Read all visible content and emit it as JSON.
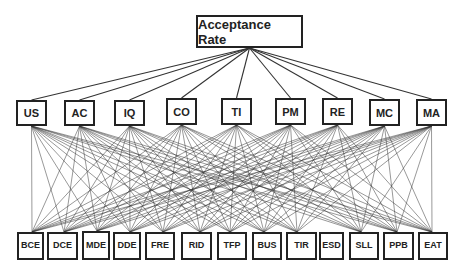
{
  "diagram": {
    "title_node": {
      "label": "Acceptance Rate",
      "x": 196,
      "y": 15,
      "w": 107,
      "h": 33
    },
    "factors": [
      {
        "id": "US",
        "label": "US",
        "x": 16,
        "y": 100,
        "w": 31,
        "h": 26
      },
      {
        "id": "AC",
        "label": "AC",
        "x": 64,
        "y": 100,
        "w": 31,
        "h": 26
      },
      {
        "id": "IQ",
        "label": "IQ",
        "x": 114,
        "y": 100,
        "w": 31,
        "h": 26
      },
      {
        "id": "CO",
        "label": "CO",
        "x": 166,
        "y": 98,
        "w": 31,
        "h": 27
      },
      {
        "id": "TI",
        "label": "TI",
        "x": 221,
        "y": 98,
        "w": 31,
        "h": 27
      },
      {
        "id": "PM",
        "label": "PM",
        "x": 275,
        "y": 98,
        "w": 31,
        "h": 27
      },
      {
        "id": "RE",
        "label": "RE",
        "x": 322,
        "y": 98,
        "w": 31,
        "h": 27
      },
      {
        "id": "MC",
        "label": "MC",
        "x": 369,
        "y": 99,
        "w": 31,
        "h": 27
      },
      {
        "id": "MA",
        "label": "MA",
        "x": 416,
        "y": 99,
        "w": 31,
        "h": 27
      }
    ],
    "indicators": [
      {
        "id": "BCE",
        "label": "BCE",
        "x": 17,
        "y": 232,
        "w": 27,
        "h": 28,
        "anchor": 32,
        "connected": true
      },
      {
        "id": "DCE",
        "label": "DCE",
        "x": 47,
        "y": 232,
        "w": 31,
        "h": 28,
        "anchor": 64,
        "connected": true
      },
      {
        "id": "MDE",
        "label": "MDE",
        "x": 82,
        "y": 231,
        "w": 28,
        "h": 29,
        "anchor": 97,
        "connected": true
      },
      {
        "id": "DDE",
        "label": "DDE",
        "x": 113,
        "y": 232,
        "w": 28,
        "h": 28,
        "anchor": 130,
        "connected": true
      },
      {
        "id": "FRE",
        "label": "FRE",
        "x": 145,
        "y": 232,
        "w": 30,
        "h": 28,
        "anchor": 163,
        "connected": true
      },
      {
        "id": "RID",
        "label": "RID",
        "x": 181,
        "y": 232,
        "w": 31,
        "h": 28,
        "anchor": 200,
        "connected": true
      },
      {
        "id": "TFP",
        "label": "TFP",
        "x": 217,
        "y": 232,
        "w": 30,
        "h": 28,
        "anchor": 230,
        "connected": true
      },
      {
        "id": "BUS",
        "label": "BUS",
        "x": 252,
        "y": 232,
        "w": 30,
        "h": 28,
        "anchor": 264,
        "connected": true
      },
      {
        "id": "TIR",
        "label": "TIR",
        "x": 286,
        "y": 232,
        "w": 31,
        "h": 28,
        "anchor": 297,
        "connected": true
      },
      {
        "id": "ESD",
        "label": "ESD",
        "x": 319,
        "y": 232,
        "w": 25,
        "h": 28,
        "anchor": 331,
        "connected": false
      },
      {
        "id": "SLL",
        "label": "SLL",
        "x": 349,
        "y": 232,
        "w": 30,
        "h": 28,
        "anchor": 361,
        "connected": true
      },
      {
        "id": "PPB",
        "label": "PPB",
        "x": 383,
        "y": 232,
        "w": 31,
        "h": 28,
        "anchor": 397,
        "connected": true
      },
      {
        "id": "EAT",
        "label": "EAT",
        "x": 418,
        "y": 232,
        "w": 30,
        "h": 28,
        "anchor": 432,
        "connected": true
      }
    ],
    "colors": {
      "line": "#333333",
      "border": "#222222",
      "text": "#222222",
      "background": "#ffffff"
    }
  }
}
